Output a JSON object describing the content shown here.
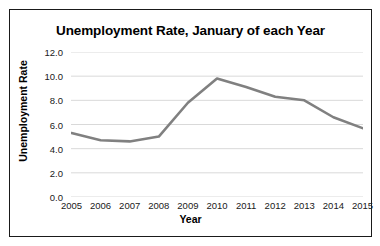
{
  "chart_data": {
    "type": "line",
    "title": "Unemployment Rate, January of each Year",
    "xlabel": "Year",
    "ylabel": "Unemployment Rate",
    "categories": [
      "2005",
      "2006",
      "2007",
      "2008",
      "2009",
      "2010",
      "2011",
      "2012",
      "2013",
      "2014",
      "2015"
    ],
    "values": [
      5.3,
      4.7,
      4.6,
      5.0,
      7.8,
      9.8,
      9.1,
      8.3,
      8.0,
      6.6,
      5.7
    ],
    "series": [
      {
        "name": "Unemployment Rate",
        "values": [
          5.3,
          4.7,
          4.6,
          5.0,
          7.8,
          9.8,
          9.1,
          8.3,
          8.0,
          6.6,
          5.7
        ]
      }
    ],
    "ylim": [
      0.0,
      12.0
    ],
    "yticks": [
      "0.0",
      "2.0",
      "4.0",
      "6.0",
      "8.0",
      "10.0",
      "12.0"
    ],
    "ytick_values": [
      0.0,
      2.0,
      4.0,
      6.0,
      8.0,
      10.0,
      12.0
    ],
    "grid": true,
    "grid_axis": "y",
    "legend": false,
    "legend_position": "none",
    "line_color": "#808080",
    "grid_color": "#d9d9d9",
    "border_color": "#1a1a1a",
    "background_color": "#ffffff",
    "text_color": "#000000",
    "line_width": 2.6,
    "markers": false
  }
}
